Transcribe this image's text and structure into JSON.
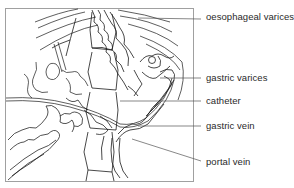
{
  "figure": {
    "labels": [
      {
        "id": "oesophageal-varices",
        "text": "oesophageal varices",
        "x": 206,
        "y": 16
      },
      {
        "id": "gastric-varices",
        "text": "gastric varices",
        "x": 206,
        "y": 74
      },
      {
        "id": "catheter",
        "text": "catheter",
        "x": 206,
        "y": 98
      },
      {
        "id": "gastric-vein",
        "text": "gastric vein",
        "x": 206,
        "y": 123
      },
      {
        "id": "portal-vein",
        "text": "portal vein",
        "x": 206,
        "y": 159
      }
    ],
    "colors": {
      "line": "#1a1a1a",
      "frame": "#9a9a9a",
      "label": "#2a2a2a",
      "background": "#ffffff"
    }
  }
}
